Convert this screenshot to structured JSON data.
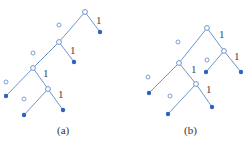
{
  "diagram": {
    "type": "binary-tree-pair",
    "colors": {
      "edge": "#6f95cc",
      "leaf": "#2f62c0",
      "text": "#444444"
    },
    "trees": [
      {
        "caption": "(a)",
        "edge_labels": {
          "left": "0",
          "right": "1"
        },
        "inner_nodes": [
          [
            85,
            12
          ],
          [
            59,
            42
          ],
          [
            33,
            68
          ],
          [
            48,
            89
          ]
        ],
        "leaves": [
          [
            100,
            32
          ],
          [
            74,
            62
          ],
          [
            6,
            96
          ],
          [
            24,
            115
          ],
          [
            63,
            110
          ]
        ],
        "edges": [
          [
            85,
            12,
            100,
            32
          ],
          [
            85,
            12,
            59,
            42
          ],
          [
            59,
            42,
            74,
            62
          ],
          [
            59,
            42,
            33,
            68
          ],
          [
            33,
            68,
            6,
            96
          ],
          [
            33,
            68,
            48,
            89
          ],
          [
            48,
            89,
            24,
            115
          ],
          [
            48,
            89,
            63,
            110
          ]
        ],
        "zero_marks": [
          [
            59,
            25
          ],
          [
            33,
            53
          ],
          [
            6,
            82
          ],
          [
            24,
            99
          ]
        ],
        "one_marks": [
          [
            96,
            24
          ],
          [
            70,
            54
          ],
          [
            43,
            77
          ],
          [
            58,
            98
          ]
        ]
      },
      {
        "caption": "(b)",
        "edge_labels": {
          "left": "0",
          "right": "1"
        },
        "inner_nodes": [
          [
            207,
            28
          ],
          [
            224,
            51
          ],
          [
            179,
            63
          ],
          [
            196,
            84
          ]
        ],
        "leaves": [
          [
            206,
            72
          ],
          [
            241,
            72
          ],
          [
            149,
            93
          ],
          [
            168,
            114
          ],
          [
            212,
            107
          ]
        ],
        "edges": [
          [
            207,
            28,
            224,
            51
          ],
          [
            207,
            28,
            179,
            63
          ],
          [
            224,
            51,
            206,
            72
          ],
          [
            224,
            51,
            241,
            72
          ],
          [
            179,
            63,
            149,
            93
          ],
          [
            179,
            63,
            196,
            84
          ],
          [
            196,
            84,
            168,
            114
          ],
          [
            196,
            84,
            212,
            107
          ]
        ],
        "zero_marks": [
          [
            178,
            42
          ],
          [
            207,
            60
          ],
          [
            148,
            77
          ],
          [
            170,
            96
          ]
        ],
        "one_marks": [
          [
            219,
            38
          ],
          [
            234,
            60
          ],
          [
            191,
            73
          ],
          [
            206,
            93
          ]
        ]
      }
    ]
  }
}
